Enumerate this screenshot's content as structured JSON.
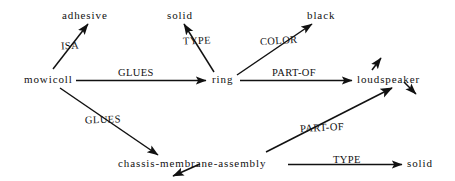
{
  "diagram": {
    "type": "semantic-network",
    "title": "",
    "nodes": [
      {
        "id": "adhesive",
        "label": "adhesive",
        "x": 62,
        "y": 10
      },
      {
        "id": "solid_top",
        "label": "solid",
        "x": 167,
        "y": 10
      },
      {
        "id": "black",
        "label": "black",
        "x": 307,
        "y": 10
      },
      {
        "id": "mowicoll",
        "label": "mowicoll",
        "x": 24,
        "y": 74
      },
      {
        "id": "ring",
        "label": "ring",
        "x": 212,
        "y": 74
      },
      {
        "id": "loudspeaker",
        "label": "loudspeaker",
        "x": 357,
        "y": 74
      },
      {
        "id": "chassis",
        "label": "chassis-membrane-assembly",
        "x": 118,
        "y": 158
      },
      {
        "id": "solid_bot",
        "label": "solid",
        "x": 407,
        "y": 158
      }
    ],
    "edges": [
      {
        "id": "e1",
        "label": "ISA",
        "from": "mowicoll",
        "to": "adhesive",
        "x": 61,
        "y": 41
      },
      {
        "id": "e2",
        "label": "GLUES",
        "from": "mowicoll",
        "to": "ring",
        "x": 118,
        "y": 68
      },
      {
        "id": "e3",
        "label": "TYPE",
        "from": "ring",
        "to": "solid_top",
        "x": 183,
        "y": 36
      },
      {
        "id": "e4",
        "label": "COLOR",
        "from": "ring",
        "to": "black",
        "x": 260,
        "y": 36
      },
      {
        "id": "e5",
        "label": "PART-OF",
        "from": "ring",
        "to": "loudspeaker",
        "x": 272,
        "y": 68
      },
      {
        "id": "e6",
        "label": "GLUES",
        "from": "mowicoll",
        "to": "chassis",
        "x": 85,
        "y": 115
      },
      {
        "id": "e7",
        "label": "PART-OF",
        "from": "chassis",
        "to": "loudspeaker",
        "x": 300,
        "y": 123
      },
      {
        "id": "e8",
        "label": "TYPE",
        "from": "chassis",
        "to": "solid_bot",
        "x": 333,
        "y": 155
      }
    ],
    "stray_arrows": [
      {
        "id": "s1",
        "description": "arrow-up-right-above-loudspeaker"
      },
      {
        "id": "s2",
        "description": "arrow-down-right-from-loudspeaker"
      },
      {
        "id": "s3",
        "description": "arrow-down-left-below-chassis"
      }
    ],
    "colors": {
      "ink": "#111111",
      "background": "#ffffff"
    }
  }
}
